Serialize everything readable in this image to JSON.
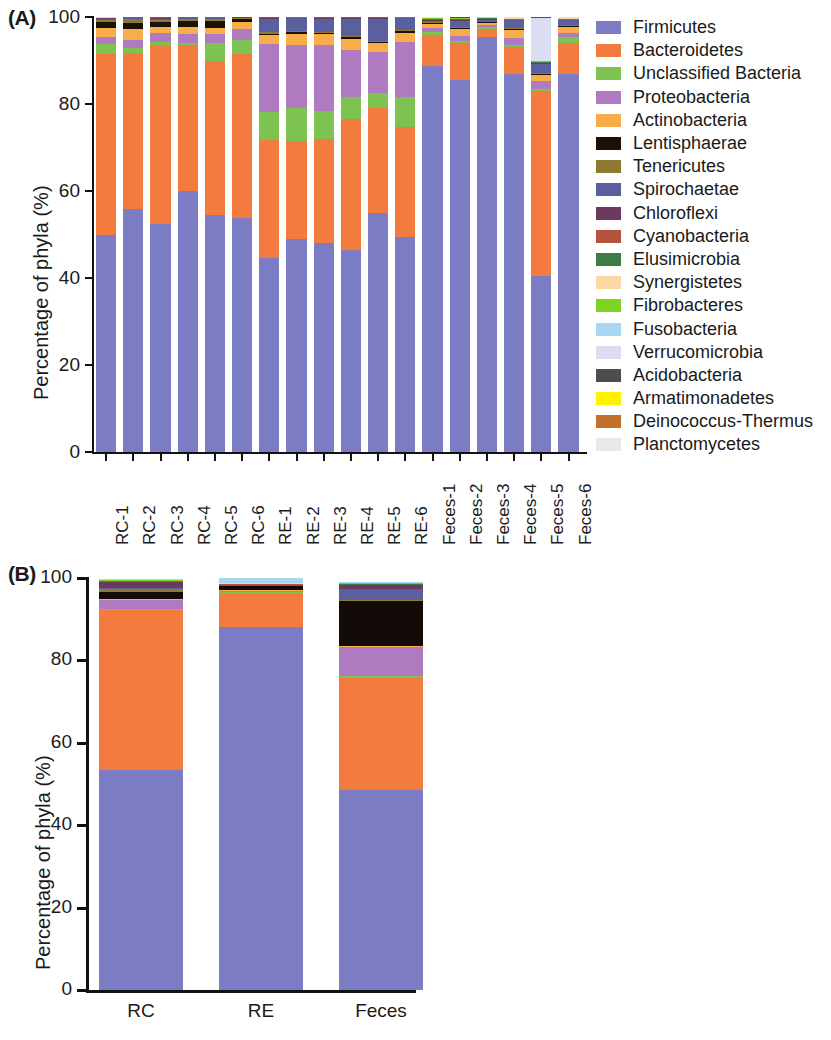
{
  "figure": {
    "panelA_letter": "(A)",
    "panelB_letter": "(B)",
    "ylabel": "Percentage of phyla (%)"
  },
  "chart_data": [
    {
      "type": "bar",
      "panel": "A",
      "stacked": true,
      "title": "",
      "xlabel": "",
      "ylabel": "Percentage of phyla (%)",
      "ylim": [
        0,
        100
      ],
      "yticks": [
        0,
        20,
        40,
        60,
        80,
        100
      ],
      "grid": false,
      "legend_position": "right",
      "categories": [
        "RC-1",
        "RC-2",
        "RC-3",
        "RC-4",
        "RC-5",
        "RC-6",
        "RE-1",
        "RE-2",
        "RE-3",
        "RE-4",
        "RE-5",
        "RE-6",
        "Feces-1",
        "Feces-2",
        "Feces-3",
        "Feces-4",
        "Feces-5",
        "Feces-6"
      ],
      "series": [
        {
          "name": "Firmicutes",
          "color": "#7b7cc4",
          "values": [
            50.0,
            55.8,
            52.5,
            60.0,
            54.5,
            53.8,
            44.7,
            49.0,
            48.0,
            46.5,
            55.0,
            49.5,
            88.8,
            85.5,
            95.5,
            87.0,
            40.5,
            87.0
          ]
        },
        {
          "name": "Bacteroidetes",
          "color": "#f47b3e",
          "values": [
            41.5,
            35.9,
            41.0,
            33.5,
            35.5,
            37.7,
            27.0,
            22.5,
            24.0,
            30.0,
            24.0,
            25.2,
            7.0,
            8.5,
            1.8,
            6.0,
            42.5,
            7.0
          ]
        },
        {
          "name": "Unclassified Bacteria",
          "color": "#7ec352",
          "values": [
            2.2,
            1.1,
            0.7,
            0.6,
            4.0,
            3.2,
            6.5,
            7.5,
            6.5,
            5.0,
            3.5,
            7.0,
            0.8,
            0.5,
            0.3,
            0.6,
            0.5,
            1.3
          ]
        },
        {
          "name": "Proteobacteria",
          "color": "#b07ac0",
          "values": [
            1.8,
            1.9,
            2.1,
            2.0,
            2.0,
            2.6,
            15.5,
            14.5,
            15.0,
            11.0,
            9.5,
            12.5,
            0.8,
            1.2,
            0.5,
            1.6,
            1.8,
            1.0
          ]
        },
        {
          "name": "Actinobacteria",
          "color": "#f9ad4a",
          "values": [
            2.0,
            2.5,
            1.5,
            1.7,
            1.5,
            1.6,
            2.2,
            2.7,
            2.5,
            2.5,
            2.0,
            2.2,
            1.0,
            1.6,
            0.6,
            1.8,
            1.4,
            1.4
          ]
        },
        {
          "name": "Lentisphaerae",
          "color": "#1a1208",
          "values": [
            1.4,
            1.5,
            1.0,
            1.2,
            1.5,
            0.6,
            0.3,
            0.3,
            0.3,
            0.3,
            0.3,
            0.3,
            0.2,
            0.2,
            0.1,
            0.2,
            0.2,
            0.2
          ]
        },
        {
          "name": "Tenericutes",
          "color": "#8f7830",
          "values": [
            0.5,
            0.8,
            0.6,
            0.5,
            0.5,
            0.3,
            0.3,
            0.3,
            0.3,
            0.3,
            0.3,
            0.3,
            0.2,
            0.2,
            0.1,
            0.2,
            0.2,
            0.2
          ]
        },
        {
          "name": "Spirochaetae",
          "color": "#5a5f9e",
          "values": [
            0.2,
            0.2,
            0.2,
            0.2,
            0.2,
            0.1,
            3.0,
            3.0,
            3.0,
            4.0,
            5.0,
            2.7,
            0.4,
            1.5,
            0.5,
            1.9,
            2.2,
            1.2
          ]
        },
        {
          "name": "Chloroflexi",
          "color": "#6b3a5e",
          "values": [
            0.1,
            0.1,
            0.1,
            0.1,
            0.1,
            0.1,
            0.2,
            0.1,
            0.2,
            0.2,
            0.1,
            0.2,
            0.1,
            0.1,
            0.1,
            0.1,
            0.1,
            0.1
          ]
        },
        {
          "name": "Cyanobacteria",
          "color": "#b5543a",
          "values": [
            0.1,
            0.1,
            0.1,
            0.1,
            0.1,
            0.0,
            0.1,
            0.1,
            0.1,
            0.1,
            0.1,
            0.1,
            0.1,
            0.1,
            0.1,
            0.1,
            0.1,
            0.1
          ]
        },
        {
          "name": "Elusimicrobia",
          "color": "#3f7b45",
          "values": [
            0.1,
            0.1,
            0.1,
            0.1,
            0.1,
            0.0,
            0.1,
            0.0,
            0.1,
            0.1,
            0.1,
            0.0,
            0.1,
            0.1,
            0.1,
            0.1,
            0.1,
            0.1
          ]
        },
        {
          "name": "Synergistetes",
          "color": "#fad9a5",
          "values": [
            0.1,
            0.0,
            0.0,
            0.0,
            0.0,
            0.0,
            0.0,
            0.0,
            0.0,
            0.0,
            0.0,
            0.0,
            0.1,
            0.1,
            0.1,
            0.1,
            0.1,
            0.1
          ]
        },
        {
          "name": "Fibrobacteres",
          "color": "#7ed321",
          "values": [
            0.0,
            0.0,
            0.0,
            0.0,
            0.0,
            0.0,
            0.0,
            0.0,
            0.0,
            0.0,
            0.0,
            0.0,
            0.1,
            0.1,
            0.1,
            0.1,
            0.1,
            0.1
          ]
        },
        {
          "name": "Fusobacteria",
          "color": "#a9d7f2",
          "values": [
            0.0,
            0.0,
            0.0,
            0.0,
            0.0,
            0.0,
            0.0,
            0.0,
            0.0,
            0.0,
            0.0,
            0.0,
            0.1,
            0.1,
            0.1,
            0.1,
            0.2,
            0.1
          ]
        },
        {
          "name": "Verrucomicrobia",
          "color": "#dcdcf2",
          "values": [
            0.0,
            0.0,
            0.0,
            0.0,
            0.0,
            0.0,
            0.0,
            0.0,
            0.0,
            0.0,
            0.0,
            0.0,
            0.1,
            0.1,
            0.1,
            0.1,
            9.8,
            0.1
          ]
        },
        {
          "name": "Acidobacteria",
          "color": "#4d4d4d",
          "values": [
            0.0,
            0.0,
            0.0,
            0.0,
            0.0,
            0.0,
            0.0,
            0.0,
            0.0,
            0.0,
            0.0,
            0.0,
            0.0,
            0.1,
            0.0,
            0.1,
            0.1,
            0.0
          ]
        },
        {
          "name": "Armatimonadetes",
          "color": "#fff200",
          "values": [
            0.0,
            0.0,
            0.0,
            0.0,
            0.0,
            0.0,
            0.0,
            0.0,
            0.0,
            0.0,
            0.0,
            0.0,
            0.0,
            0.0,
            0.0,
            0.0,
            0.0,
            0.0
          ]
        },
        {
          "name": "Deinococcus-Thermus",
          "color": "#c2702a",
          "values": [
            0.0,
            0.0,
            0.0,
            0.0,
            0.0,
            0.0,
            0.0,
            0.0,
            0.0,
            0.0,
            0.0,
            0.0,
            0.0,
            0.0,
            0.0,
            0.0,
            0.0,
            0.0
          ]
        },
        {
          "name": "Planctomycetes",
          "color": "#e8e8e8",
          "values": [
            0.0,
            0.0,
            0.0,
            0.0,
            0.0,
            0.0,
            0.0,
            0.0,
            0.0,
            0.0,
            0.0,
            0.0,
            0.0,
            0.0,
            0.0,
            0.0,
            0.0,
            0.0
          ]
        }
      ]
    },
    {
      "type": "bar",
      "panel": "B",
      "stacked": true,
      "title": "",
      "xlabel": "",
      "ylabel": "Percentage of phyla (%)",
      "ylim": [
        0,
        100
      ],
      "yticks": [
        0,
        20,
        40,
        60,
        80,
        100
      ],
      "grid": false,
      "legend_position": "right",
      "categories": [
        "RC",
        "RE",
        "Feces"
      ],
      "series": [
        {
          "name": "Firmicutes",
          "color": "#7b7cc4",
          "values": [
            53.5,
            88.0,
            48.5
          ]
        },
        {
          "name": "Bacteroidetes",
          "color": "#f47b3e",
          "values": [
            38.8,
            8.5,
            27.3
          ]
        },
        {
          "name": "Synergistetes",
          "color": "#7ec352",
          "values": [
            0.3,
            0.2,
            0.5
          ]
        },
        {
          "name": "Unclassified Bacteria",
          "color": "#b07ac0",
          "values": [
            2.0,
            0.2,
            7.0
          ]
        },
        {
          "name": "Chloroflexi",
          "color": "#f9ad4a",
          "values": [
            0.3,
            0.1,
            0.2
          ]
        },
        {
          "name": "Proteobacteria",
          "color": "#120b08",
          "values": [
            1.7,
            1.0,
            11.0
          ]
        },
        {
          "name": "Lentisphaerae",
          "color": "#8f7830",
          "values": [
            0.8,
            0.1,
            0.2
          ]
        },
        {
          "name": "Spirochaetae",
          "color": "#5a5f9e",
          "values": [
            0.2,
            0.2,
            2.6
          ]
        },
        {
          "name": "Tenericutes",
          "color": "#6b3a5e",
          "values": [
            1.5,
            0.1,
            1.0
          ]
        },
        {
          "name": "Fibrobacteres",
          "color": "#b5543a",
          "values": [
            0.1,
            0.1,
            0.1
          ]
        },
        {
          "name": "Deinococcus-Thermus",
          "color": "#3f7b45",
          "values": [
            0.1,
            0.1,
            0.1
          ]
        },
        {
          "name": "Elusimicrobia",
          "color": "#fad9a5",
          "values": [
            0.1,
            0.1,
            0.1
          ]
        },
        {
          "name": "Fusobacteria",
          "color": "#7ed321",
          "values": [
            0.1,
            0.1,
            0.1
          ]
        },
        {
          "name": "Verrucomicrobia",
          "color": "#a9d7f2",
          "values": [
            0.2,
            2.0,
            0.2
          ]
        }
      ]
    }
  ],
  "panelA": {
    "letter": "(A)",
    "ylabel": "Percentage of phyla (%)",
    "yticks": [
      "100",
      "80",
      "60",
      "40",
      "20",
      "0"
    ],
    "xticklabels": [
      "RC-1",
      "RC-2",
      "RC-3",
      "RC-4",
      "RC-5",
      "RC-6",
      "RE-1",
      "RE-2",
      "RE-3",
      "RE-4",
      "RE-5",
      "RE-6",
      "Feces-1",
      "Feces-2",
      "Feces-3",
      "Feces-4",
      "Feces-5",
      "Feces-6"
    ],
    "legend": [
      {
        "label": "Firmicutes",
        "color": "#7b7cc4"
      },
      {
        "label": "Bacteroidetes",
        "color": "#f47b3e"
      },
      {
        "label": "Unclassified Bacteria",
        "color": "#7ec352"
      },
      {
        "label": "Proteobacteria",
        "color": "#b07ac0"
      },
      {
        "label": "Actinobacteria",
        "color": "#f9ad4a"
      },
      {
        "label": "Lentisphaerae",
        "color": "#1a1208"
      },
      {
        "label": "Tenericutes",
        "color": "#8f7830"
      },
      {
        "label": "Spirochaetae",
        "color": "#5a5f9e"
      },
      {
        "label": "Chloroflexi",
        "color": "#6b3a5e"
      },
      {
        "label": "Cyanobacteria",
        "color": "#b5543a"
      },
      {
        "label": "Elusimicrobia",
        "color": "#3f7b45"
      },
      {
        "label": "Synergistetes",
        "color": "#fad9a5"
      },
      {
        "label": "Fibrobacteres",
        "color": "#7ed321"
      },
      {
        "label": "Fusobacteria",
        "color": "#a9d7f2"
      },
      {
        "label": "Verrucomicrobia",
        "color": "#dcdcf2"
      },
      {
        "label": "Acidobacteria",
        "color": "#4d4d4d"
      },
      {
        "label": "Armatimonadetes",
        "color": "#fff200"
      },
      {
        "label": "Deinococcus-Thermus",
        "color": "#c2702a"
      },
      {
        "label": "Planctomycetes",
        "color": "#e8e8e8"
      }
    ]
  },
  "panelB": {
    "letter": "(B)",
    "ylabel": "Percentage of phyla (%)",
    "yticks": [
      "100",
      "80",
      "60",
      "40",
      "20",
      "0"
    ],
    "xticklabels": [
      "RC",
      "RE",
      "Feces"
    ],
    "legend": [
      {
        "label": "Verrucomicrobia",
        "color": "#a9d7f2"
      },
      {
        "label": "Fusobacteria",
        "color": "#7ed321"
      },
      {
        "label": "Elusimicrobia",
        "color": "#fad9a5"
      },
      {
        "label": "Deinococcus-Thermus",
        "color": "#3f7b45"
      },
      {
        "label": "Fibrobacteres",
        "color": "#b5543a"
      },
      {
        "label": "Tenericutes",
        "color": "#6b3a5e"
      },
      {
        "label": "Spirochaetae",
        "color": "#5a5f9e"
      },
      {
        "label": "Lentisphaerae",
        "color": "#8f7830"
      },
      {
        "label": "Proteobacteria",
        "color": "#120b08"
      },
      {
        "label": "Chloroflexi",
        "color": "#f9ad4a"
      },
      {
        "label": "Unclassified Bacteria",
        "color": "#b07ac0"
      },
      {
        "label": "Synergistetes",
        "color": "#7ec352"
      },
      {
        "label": "Bacteroidetes",
        "color": "#f47b3e"
      },
      {
        "label": "Firmicutes",
        "color": "#7b7cc4"
      }
    ]
  }
}
